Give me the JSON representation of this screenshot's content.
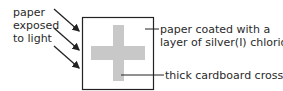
{
  "labels": {
    "left_line1": "paper",
    "left_line2": "exposed",
    "left_line3": "to light",
    "right_top_line1": "paper coated with a",
    "right_top_line2": "layer of silver(I) chloride",
    "right_bottom": "thick cardboard cross"
  },
  "colors": {
    "cross": "#c8c8c8",
    "box_border": "#222222",
    "arrow": "#222222"
  }
}
